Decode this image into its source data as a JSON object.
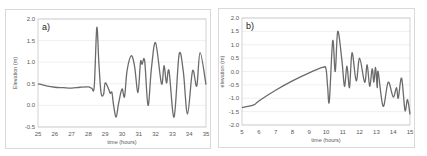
{
  "chart_data": [
    {
      "type": "line",
      "panel_label": "a)",
      "title": "",
      "xlabel": "time (hours)",
      "ylabel": "Elevation (m)",
      "xlim": [
        25,
        35
      ],
      "ylim": [
        -0.5,
        2.0
      ],
      "xticks": [
        25,
        26,
        27,
        28,
        29,
        30,
        31,
        32,
        33,
        34,
        35
      ],
      "yticks": [
        "2.0",
        "1.5",
        "1.0",
        "0.5",
        "0.0",
        "-0.5"
      ],
      "grid": "horizontal",
      "line_color": "#6b6b6b",
      "x": [
        25,
        25.5,
        26,
        26.5,
        27,
        27.5,
        28,
        28.2,
        28.35,
        28.5,
        28.62,
        28.75,
        28.9,
        29.0,
        29.2,
        29.3,
        29.4,
        29.5,
        29.65,
        29.8,
        30.0,
        30.15,
        30.3,
        30.55,
        30.75,
        30.95,
        31.1,
        31.2,
        31.35,
        31.55,
        31.75,
        32.0,
        32.35,
        32.5,
        32.65,
        32.8,
        33.1,
        33.4,
        33.65,
        33.9,
        34.2,
        34.45,
        34.65,
        35.0
      ],
      "y": [
        0.5,
        0.45,
        0.42,
        0.41,
        0.4,
        0.42,
        0.43,
        0.4,
        0.45,
        1.8,
        1.0,
        0.3,
        0.25,
        0.52,
        0.38,
        0.28,
        0.3,
        0.0,
        -0.27,
        0.05,
        0.38,
        0.2,
        0.8,
        1.15,
        0.9,
        0.3,
        1.0,
        0.95,
        1.03,
        0.0,
        0.85,
        1.45,
        0.5,
        0.92,
        0.52,
        0.8,
        -0.27,
        1.18,
        0.78,
        -0.2,
        0.8,
        0.45,
        1.22,
        0.48
      ]
    },
    {
      "type": "line",
      "panel_label": "b)",
      "title": "",
      "xlabel": "time (hours)",
      "ylabel": "elevation (m)",
      "xlim": [
        5,
        15
      ],
      "ylim": [
        -2.0,
        2.0
      ],
      "xticks": [
        5,
        6,
        7,
        8,
        9,
        10,
        11,
        12,
        13,
        14,
        15
      ],
      "yticks": [
        "2.0",
        "1.5",
        "1.0",
        "0.5",
        "0.0",
        "-0.5",
        "-1.0",
        "-1.5",
        "-2.0"
      ],
      "grid": "horizontal",
      "line_color": "#6b6b6b",
      "x": [
        5,
        5.7,
        6,
        7,
        8,
        9,
        9.8,
        10.0,
        10.1,
        10.2,
        10.4,
        10.55,
        10.7,
        10.95,
        11.1,
        11.25,
        11.4,
        11.55,
        11.8,
        12.0,
        12.3,
        12.45,
        12.6,
        12.75,
        12.85,
        12.95,
        13.05,
        13.1,
        13.4,
        13.7,
        14.0,
        14.2,
        14.3,
        14.5,
        14.7,
        14.85,
        15.0
      ],
      "y": [
        -1.35,
        -1.25,
        -1.1,
        -0.7,
        -0.35,
        -0.05,
        0.15,
        0.1,
        -0.6,
        -1.1,
        1.15,
        0.0,
        1.5,
        0.4,
        -0.55,
        0.2,
        -0.6,
        0.7,
        -0.35,
        0.5,
        -0.4,
        0.25,
        -0.55,
        0.1,
        -0.4,
        0.15,
        -0.6,
        0.0,
        -1.3,
        -0.4,
        -0.95,
        -0.6,
        -1.0,
        -0.25,
        -1.45,
        -1.05,
        -1.6
      ]
    }
  ]
}
